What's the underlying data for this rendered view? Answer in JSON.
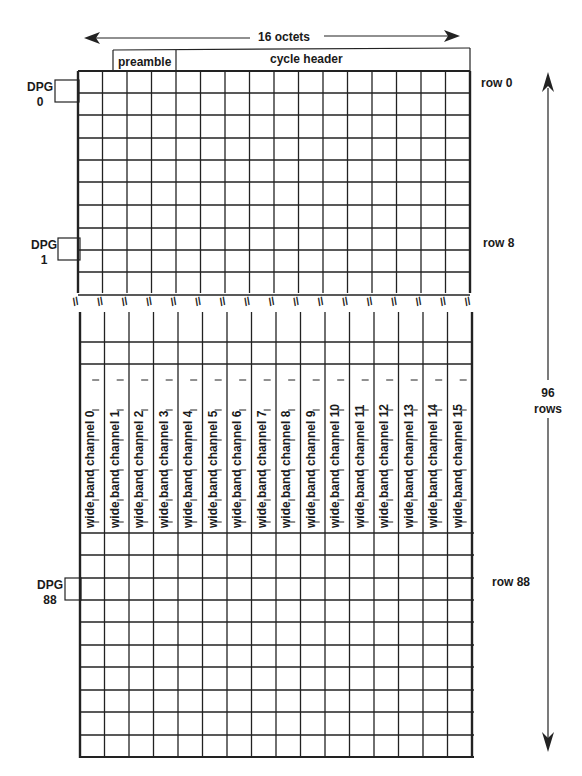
{
  "title": {
    "octets_label": "16 octets",
    "preamble_label": "preamble",
    "cycle_header_label": "cycle header"
  },
  "dpg_labels": [
    {
      "name": "DPG",
      "number": "0"
    },
    {
      "name": "DPG",
      "number": "1"
    },
    {
      "name": "DPG",
      "number": "88"
    }
  ],
  "row_labels": [
    "row 0",
    "row 8",
    "row 88"
  ],
  "rows_total": {
    "count": "96",
    "unit": "rows"
  },
  "break_marker": "//",
  "grid": {
    "columns": 16,
    "top_rows": 10,
    "middle_rows": 2,
    "bottom_rows": 10,
    "line_color": "#222222"
  },
  "channels": [
    "wide band channel 0",
    "wide band channel 1",
    "wide band channel 2",
    "wide band channel 3",
    "wide band channel 4",
    "wide band channel 5",
    "wide band channel 6",
    "wide band channel 7",
    "wide band channel 8",
    "wide band channel 9",
    "wide band channel 10",
    "wide band channel 11",
    "wide band channel 12",
    "wide band channel 13",
    "wide band channel 14",
    "wide band channel 15"
  ]
}
